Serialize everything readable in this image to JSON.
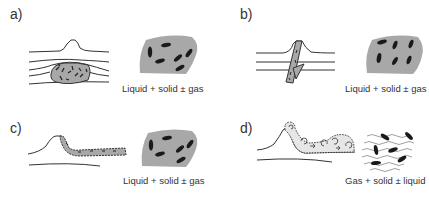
{
  "panels": [
    {
      "label": "a)",
      "caption": "Liquid + solid ± gas",
      "sketch": "sill-intrusion-beneath-dome"
    },
    {
      "label": "b)",
      "caption": "Liquid + solid ± gas",
      "sketch": "dyke-feeding-dome"
    },
    {
      "label": "c)",
      "caption": "Liquid + solid ± gas",
      "sketch": "lava-flow-from-dome"
    },
    {
      "label": "d)",
      "caption": "Gas + solid ± liquid",
      "sketch": "pyroclastic-density-current"
    }
  ],
  "colors": {
    "line": "#333333",
    "magma_fill": "#a8a8a8",
    "crystal": "#1a1a1a",
    "flow_fill": "#e6e6e6"
  }
}
